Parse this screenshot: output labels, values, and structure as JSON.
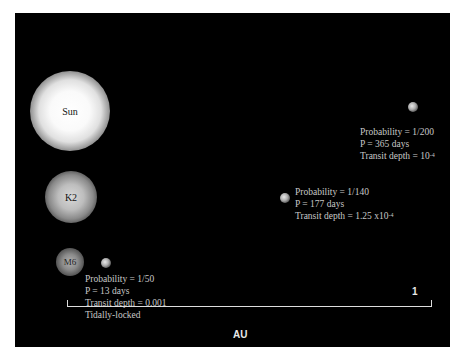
{
  "stars": [
    {
      "name": "Sun"
    },
    {
      "name": "K2"
    },
    {
      "name": "M6"
    }
  ],
  "planets": [
    {
      "probability": "Probability = 1/200",
      "period": "P = 365 days",
      "transit_prefix": "Transit depth = 10",
      "transit_exp": "-4"
    },
    {
      "probability": "Probability = 1/140",
      "period": "P = 177 days",
      "transit_prefix": "Transit depth = 1.25 x10",
      "transit_exp": "-4"
    },
    {
      "probability": "Probability = 1/50",
      "period": "P = 13 days",
      "transit": "Transit depth = 0.001",
      "note": "Tidally-locked"
    }
  ],
  "axis": {
    "end_label": "1",
    "unit_label": "AU"
  }
}
